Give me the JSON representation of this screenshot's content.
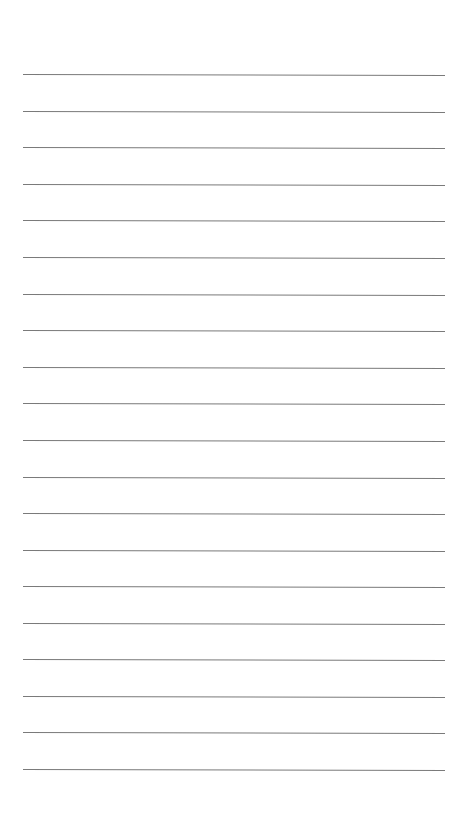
{
  "page": {
    "type": "ruled-paper",
    "background_color": "#ffffff",
    "line_color": "#7a7a7a",
    "line_count": 20,
    "line_left": 23,
    "line_right": 445,
    "first_line_y": 74,
    "line_spacing": 36.6,
    "lines": [
      {
        "y": 74,
        "text": ""
      },
      {
        "y": 111,
        "text": ""
      },
      {
        "y": 147,
        "text": ""
      },
      {
        "y": 184,
        "text": ""
      },
      {
        "y": 220,
        "text": ""
      },
      {
        "y": 257,
        "text": ""
      },
      {
        "y": 294,
        "text": ""
      },
      {
        "y": 330,
        "text": ""
      },
      {
        "y": 367,
        "text": ""
      },
      {
        "y": 403,
        "text": ""
      },
      {
        "y": 440,
        "text": ""
      },
      {
        "y": 477,
        "text": ""
      },
      {
        "y": 513,
        "text": ""
      },
      {
        "y": 550,
        "text": ""
      },
      {
        "y": 586,
        "text": ""
      },
      {
        "y": 623,
        "text": ""
      },
      {
        "y": 659,
        "text": ""
      },
      {
        "y": 696,
        "text": ""
      },
      {
        "y": 732,
        "text": ""
      },
      {
        "y": 769,
        "text": ""
      }
    ]
  }
}
